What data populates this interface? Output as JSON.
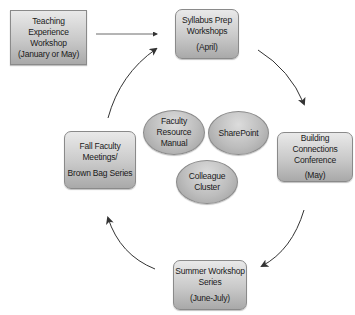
{
  "diagram": {
    "type": "cycle",
    "nodes": {
      "teaching": {
        "line1": "Teaching Experience",
        "line2": "Workshop",
        "line3": "(January or May)"
      },
      "syllabus": {
        "line1": "Syllabus Prep",
        "line2": "Workshops",
        "line3": "(April)"
      },
      "building": {
        "line1": "Building Connections",
        "line2": "Conference",
        "line3": "(May)"
      },
      "summer": {
        "line1": "Summer Workshop",
        "line2": "Series",
        "line3": "(June-July)"
      },
      "fall": {
        "line1": "Fall Faculty",
        "line2": "Meetings/",
        "line3": "Brown Bag Series"
      }
    },
    "center_resources": {
      "manual": {
        "line1": "Faculty",
        "line2": "Resource",
        "line3": "Manual"
      },
      "sharepoint": {
        "line1": "SharePoint"
      },
      "cluster": {
        "line1": "Colleague",
        "line2": "Cluster"
      }
    },
    "edges": [
      {
        "from": "Teaching Experience Workshop",
        "to": "Syllabus Prep Workshops"
      },
      {
        "from": "Syllabus Prep Workshops",
        "to": "Building Connections Conference"
      },
      {
        "from": "Building Connections Conference",
        "to": "Summer Workshop Series"
      },
      {
        "from": "Summer Workshop Series",
        "to": "Fall Faculty Meetings/Brown Bag Series"
      },
      {
        "from": "Fall Faculty Meetings/Brown Bag Series",
        "to": "Syllabus Prep Workshops"
      }
    ],
    "colors": {
      "arrow": "#333333",
      "node_border": "#8a8a8a",
      "node_fill_top": "#e9e9e9",
      "node_fill_bottom": "#a9a9a9"
    }
  }
}
